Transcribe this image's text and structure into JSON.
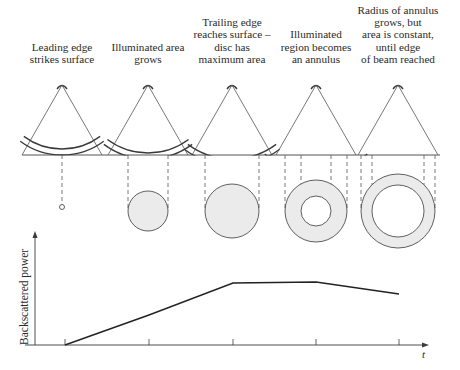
{
  "colors": {
    "ink": "#3a3a3a",
    "line": "#555555",
    "fill": "#ebebeb",
    "background": "#ffffff"
  },
  "stages": [
    {
      "id": "stage-1",
      "caption_lines": [
        "Leading edge",
        "strikes surface"
      ],
      "apex_x": 62,
      "footprint": "point",
      "footprint_center": [
        62,
        207
      ],
      "outer_radius": 2.5,
      "inner_radius": 0
    },
    {
      "id": "stage-2",
      "caption_lines": [
        "Illuminated area",
        "grows"
      ],
      "apex_x": 148,
      "footprint": "disc",
      "footprint_center": [
        148,
        211
      ],
      "outer_radius": 20,
      "inner_radius": 0
    },
    {
      "id": "stage-3",
      "caption_lines": [
        "Trailing edge",
        "reaches surface –",
        "disc has",
        "maximum area"
      ],
      "apex_x": 232,
      "footprint": "disc",
      "footprint_center": [
        232,
        211
      ],
      "outer_radius": 27,
      "inner_radius": 0
    },
    {
      "id": "stage-4",
      "caption_lines": [
        "Illuminated",
        "region becomes",
        "an annulus"
      ],
      "apex_x": 316,
      "footprint": "annulus",
      "footprint_center": [
        316,
        211
      ],
      "outer_radius": 31,
      "inner_radius": 15
    },
    {
      "id": "stage-5",
      "caption_lines": [
        "Radius of annulus",
        "grows, but",
        "area is constant,",
        "until edge",
        "of beam reached"
      ],
      "apex_x": 398,
      "footprint": "annulus",
      "footprint_center": [
        398,
        211
      ],
      "outer_radius": 37,
      "inner_radius": 26
    }
  ],
  "surface": {
    "y": 155,
    "x_start": 22,
    "x_end": 440
  },
  "chart_data": {
    "type": "line",
    "title": "",
    "xlabel": "t",
    "ylabel": "Backscattered power",
    "x_ticks": [
      "stage 1",
      "stage 2",
      "stage 3",
      "stage 4",
      "stage 5"
    ],
    "x": [
      1,
      2,
      3,
      4,
      5
    ],
    "series": [
      {
        "name": "Backscattered power",
        "values": [
          0,
          0.48,
          1.0,
          1.01,
          0.82
        ]
      }
    ],
    "ylim": [
      0,
      1.5
    ],
    "grid": false,
    "legend": "none",
    "pixel_points": [
      [
        65,
        345
      ],
      [
        149,
        315
      ],
      [
        233,
        283
      ],
      [
        316,
        282
      ],
      [
        399,
        294
      ]
    ],
    "tick_x_pixels": [
      65,
      149,
      233,
      316,
      399
    ]
  },
  "axes": {
    "y_axis_label": "Backscattered power",
    "x_axis_label": "t"
  }
}
